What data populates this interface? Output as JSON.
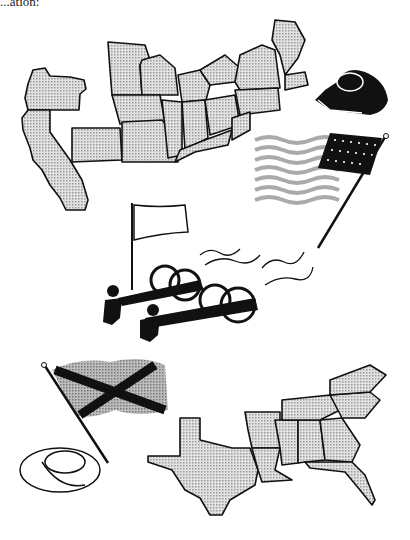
{
  "page": {
    "cut_text": "...ation:",
    "illustrations": [
      {
        "id": "west-coast-map",
        "label": "Pacific states map (Oregon, California)"
      },
      {
        "id": "union-map",
        "label": "Northern Union states map"
      },
      {
        "id": "union-kepi-hat",
        "label": "Union kepi cap"
      },
      {
        "id": "us-flag",
        "label": "Union US flag with stars"
      },
      {
        "id": "white-flag",
        "label": "White flag on pole"
      },
      {
        "id": "cannons-with-soldiers",
        "label": "Two cannons fired by soldiers"
      },
      {
        "id": "confederate-flag",
        "label": "Confederate battle flag"
      },
      {
        "id": "confederate-hat",
        "label": "Confederate slouch hat"
      },
      {
        "id": "confederacy-map",
        "label": "Southern Confederate states map"
      }
    ],
    "colors": {
      "ink": "#111111",
      "fill_gray": "#c8c8c8",
      "background": "#ffffff"
    }
  }
}
